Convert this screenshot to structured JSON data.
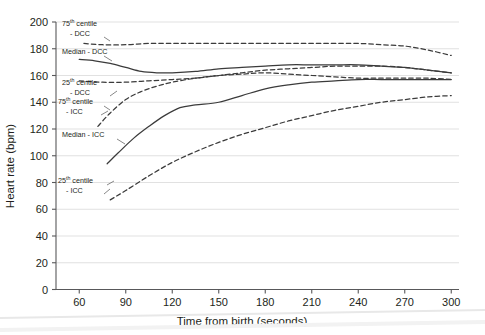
{
  "chart_data": {
    "type": "line",
    "title": "",
    "xlabel": "Time from birth (seconds)",
    "ylabel": "Heart rate (bpm)",
    "xlim": [
      45,
      305
    ],
    "ylim": [
      0,
      200
    ],
    "xticks": [
      60,
      90,
      120,
      150,
      180,
      210,
      240,
      270,
      300
    ],
    "yticks": [
      0,
      20,
      40,
      60,
      80,
      100,
      120,
      140,
      160,
      180,
      200
    ],
    "grid": "horizontal",
    "legend": "inline-annotations",
    "line_color": "#3b3b3b",
    "grid_color": "#d9d9d9",
    "axis_color": "#58585a",
    "series": [
      {
        "name": "75th centile - DCC",
        "style": "dashed",
        "x": [
          63,
          75,
          90,
          105,
          120,
          135,
          150,
          165,
          180,
          195,
          210,
          225,
          240,
          255,
          270,
          285,
          300
        ],
        "values": [
          184,
          183,
          183,
          184,
          184,
          184,
          184,
          184,
          184,
          184,
          184,
          184,
          184,
          183,
          182,
          179,
          175
        ]
      },
      {
        "name": "Median - DCC",
        "style": "solid",
        "x": [
          60,
          70,
          80,
          90,
          100,
          110,
          120,
          135,
          150,
          165,
          180,
          195,
          210,
          225,
          240,
          255,
          270,
          285,
          300
        ],
        "values": [
          172,
          171,
          169,
          166,
          163,
          162,
          162,
          163,
          165,
          166,
          167,
          168,
          168,
          168,
          168,
          167,
          166,
          164,
          162
        ]
      },
      {
        "name": "25th centile - DCC",
        "style": "dashed",
        "x": [
          60,
          75,
          90,
          105,
          120,
          135,
          150,
          165,
          180,
          195,
          210,
          225,
          240,
          255,
          270,
          285,
          300
        ],
        "values": [
          156,
          155,
          155,
          156,
          157,
          158,
          160,
          161,
          162,
          161,
          160,
          159,
          158,
          158,
          158,
          158,
          157
        ]
      },
      {
        "name": "75th centile - ICC",
        "style": "dashed",
        "x": [
          72,
          80,
          90,
          100,
          110,
          120,
          135,
          150,
          165,
          180,
          195,
          210,
          225,
          240,
          255,
          270,
          285,
          300
        ],
        "values": [
          122,
          132,
          142,
          148,
          152,
          155,
          158,
          160,
          162,
          164,
          165,
          166,
          167,
          167,
          167,
          166,
          164,
          162
        ]
      },
      {
        "name": "Median - ICC",
        "style": "solid",
        "x": [
          78,
          85,
          95,
          105,
          115,
          125,
          135,
          150,
          165,
          180,
          195,
          210,
          225,
          240,
          255,
          270,
          285,
          300
        ],
        "values": [
          94,
          102,
          113,
          122,
          130,
          136,
          138,
          140,
          145,
          150,
          153,
          155,
          156,
          157,
          157,
          157,
          157,
          157
        ]
      },
      {
        "name": "25th centile - ICC",
        "style": "dashed",
        "x": [
          80,
          90,
          105,
          120,
          135,
          150,
          165,
          180,
          195,
          210,
          225,
          240,
          255,
          270,
          285,
          300
        ],
        "values": [
          67,
          74,
          85,
          95,
          103,
          110,
          116,
          121,
          126,
          130,
          134,
          137,
          140,
          142,
          144,
          145
        ]
      }
    ],
    "annotations": [
      {
        "id": "ann-75-dcc",
        "lines": [
          "75th centile",
          "- DCC"
        ],
        "sup": "th"
      },
      {
        "id": "ann-median-dcc",
        "lines": [
          "Median - DCC"
        ],
        "sup": ""
      },
      {
        "id": "ann-25-dcc",
        "lines": [
          "25th centile",
          "- DCC"
        ],
        "sup": "th"
      },
      {
        "id": "ann-75-icc",
        "lines": [
          "75th centile",
          "- ICC"
        ],
        "sup": "th"
      },
      {
        "id": "ann-median-icc",
        "lines": [
          "Median - ICC"
        ],
        "sup": ""
      },
      {
        "id": "ann-25-icc",
        "lines": [
          "25th centile",
          "- ICC"
        ],
        "sup": "th"
      }
    ]
  },
  "labels": {
    "y_axis_title": "Heart rate (bpm)",
    "x_axis_title": "Time from birth (seconds)",
    "yticks": [
      "0",
      "20",
      "40",
      "60",
      "80",
      "100",
      "120",
      "140",
      "160",
      "180",
      "200"
    ],
    "xticks": [
      "60",
      "90",
      "120",
      "150",
      "180",
      "210",
      "240",
      "270",
      "300"
    ],
    "ann": {
      "a75dcc_1": "75",
      "a75dcc_sup": "th",
      "a75dcc_2": " centile",
      "a75dcc_3": "- DCC",
      "amedcc": "Median - DCC",
      "a25dcc_1": "25",
      "a25dcc_sup": "th",
      "a25dcc_2": " centile",
      "a25dcc_3": "- DCC",
      "a75icc_1": "75",
      "a75icc_sup": "th",
      "a75icc_2": " centile",
      "a75icc_3": "- ICC",
      "ameicc": "Median - ICC",
      "a25icc_1": "25",
      "a25icc_sup": "th",
      "a25icc_2": " centile",
      "a25icc_3": "- ICC"
    }
  }
}
